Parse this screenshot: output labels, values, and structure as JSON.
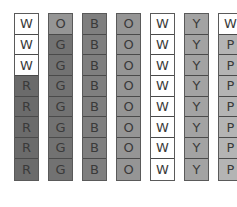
{
  "colors": {
    "W": "#ffffff",
    "R": "#6b6b6b",
    "O": "#959595",
    "G": "#727272",
    "B": "#7f7f7f",
    "Y": "#a3a3a3",
    "P": "#b4b4b4"
  },
  "columns": [
    {
      "cells": [
        "W",
        "W",
        "W",
        "R",
        "R",
        "R",
        "R",
        "R"
      ]
    },
    {
      "cells": [
        "O",
        "G",
        "G",
        "G",
        "G",
        "G",
        "G",
        "G"
      ]
    },
    {
      "cells": [
        "B",
        "B",
        "B",
        "B",
        "B",
        "B",
        "B",
        "B"
      ]
    },
    {
      "cells": [
        "O",
        "O",
        "O",
        "O",
        "O",
        "O",
        "O",
        "O"
      ]
    },
    {
      "cells": [
        "W",
        "W",
        "W",
        "W",
        "W",
        "W",
        "W",
        "W"
      ]
    },
    {
      "cells": [
        "Y",
        "Y",
        "Y",
        "Y",
        "Y",
        "Y",
        "Y",
        "Y"
      ]
    },
    {
      "cells": [
        "W",
        "P",
        "P",
        "P",
        "P",
        "P",
        "P",
        "P"
      ]
    }
  ]
}
